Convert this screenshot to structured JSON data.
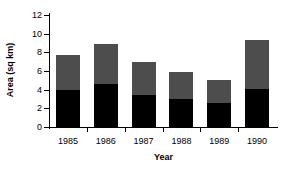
{
  "chart_data": {
    "type": "bar",
    "title": "",
    "xlabel": "Year",
    "ylabel": "Area (sq km)",
    "stacked": true,
    "grid": false,
    "legend": "none",
    "categories": [
      "1985",
      "1986",
      "1987",
      "1988",
      "1989",
      "1990"
    ],
    "ylim": [
      0,
      12
    ],
    "yticks": [
      0,
      2,
      4,
      6,
      8,
      10,
      12
    ],
    "ytick_labels": [
      "0",
      "2",
      "4",
      "6",
      "8",
      "10",
      "12"
    ],
    "series": [
      {
        "name": "lower-segment",
        "color": "#000000",
        "values": [
          4.0,
          4.6,
          3.4,
          3.0,
          2.6,
          4.1
        ]
      },
      {
        "name": "upper-segment",
        "color": "#4d4d4d",
        "values": [
          3.7,
          4.3,
          3.6,
          2.9,
          2.4,
          5.2
        ]
      }
    ],
    "totals": [
      7.7,
      8.9,
      7.0,
      5.9,
      5.0,
      9.3
    ]
  }
}
